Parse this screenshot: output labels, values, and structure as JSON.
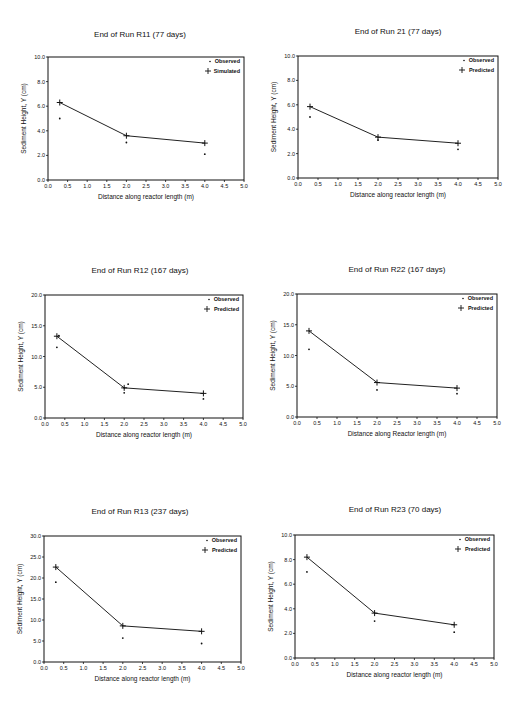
{
  "page": {
    "caption": ""
  },
  "chart_data": [
    {
      "id": "r11",
      "type": "line",
      "title": "End of Run R11 (77 days)",
      "xlabel": "Distance along reactor length (m)",
      "ylabel": "Sediment Height, Y (cm)",
      "xlim": [
        0.0,
        5.0
      ],
      "ylim": [
        0.0,
        10.0
      ],
      "xticks": [
        "0.0",
        "0.5",
        "1.0",
        "1.5",
        "2.0",
        "2.5",
        "3.0",
        "3.5",
        "4.0",
        "4.5",
        "5.0"
      ],
      "yticks": [
        "0.0",
        "2.0",
        "4.0",
        "6.0",
        "8.0",
        "10.0"
      ],
      "legend": [
        "Observed",
        "Simulated"
      ],
      "legend_position": "upper right",
      "grid": false,
      "series": [
        {
          "name": "Simulated",
          "style": "line+cross",
          "x": [
            0.3,
            2.0,
            4.0
          ],
          "y": [
            6.3,
            3.6,
            3.0
          ]
        },
        {
          "name": "Observed",
          "style": "dot",
          "x": [
            0.3,
            2.0,
            4.0
          ],
          "y": [
            5.0,
            3.05,
            2.1
          ]
        }
      ],
      "frame": {
        "left": 48,
        "right": 244,
        "top": 57,
        "bottom": 180,
        "title_y": 30,
        "title_x": 140
      }
    },
    {
      "id": "r21",
      "type": "line",
      "title": "End of Run 21 (77 days)",
      "xlabel": "Distance along reactor length (m)",
      "ylabel": "Sediment Height, Y (cm)",
      "xlim": [
        0.0,
        5.0
      ],
      "ylim": [
        0.0,
        10.0
      ],
      "xticks": [
        "0.0",
        "0.5",
        "1.0",
        "1.5",
        "2.0",
        "2.5",
        "3.0",
        "3.5",
        "4.0",
        "4.5",
        "5.0"
      ],
      "yticks": [
        "0.0",
        "2.0",
        "4.0",
        "6.0",
        "8.0",
        "10.0"
      ],
      "legend": [
        "Observed",
        "Predicted"
      ],
      "legend_position": "upper right",
      "grid": false,
      "series": [
        {
          "name": "Predicted",
          "style": "line+cross",
          "x": [
            0.3,
            2.0,
            4.0
          ],
          "y": [
            5.85,
            3.35,
            2.85
          ]
        },
        {
          "name": "Observed",
          "style": "dot",
          "x": [
            0.3,
            2.0,
            4.0
          ],
          "y": [
            5.0,
            3.1,
            2.35
          ]
        }
      ],
      "frame": {
        "left": 298,
        "right": 498,
        "top": 56,
        "bottom": 178,
        "title_y": 27,
        "title_x": 398
      }
    },
    {
      "id": "r12",
      "type": "line",
      "title": "End of Run R12 (167 days)",
      "xlabel": "Distance along reactor length (m)",
      "ylabel": "Sediment Height, Y (cm)",
      "xlim": [
        0.0,
        5.0
      ],
      "ylim": [
        0.0,
        20.0
      ],
      "xticks": [
        "0.0",
        "0.5",
        "1.0",
        "1.5",
        "2.0",
        "2.5",
        "3.0",
        "3.5",
        "4.0",
        "4.5",
        "5.0"
      ],
      "yticks": [
        "0.0",
        "5.0",
        "10.0",
        "15.0",
        "20.0"
      ],
      "legend": [
        "Observed",
        "Predicted"
      ],
      "legend_position": "upper right",
      "grid": false,
      "series": [
        {
          "name": "Predicted",
          "style": "line+cross",
          "x": [
            0.3,
            2.0,
            4.0
          ],
          "y": [
            13.3,
            4.9,
            4.0
          ]
        },
        {
          "name": "Observed",
          "style": "dot",
          "x": [
            0.3,
            0.35,
            2.0,
            2.0,
            2.1,
            4.0
          ],
          "y": [
            11.5,
            13.4,
            4.1,
            4.9,
            5.5,
            3.1
          ]
        }
      ],
      "frame": {
        "left": 45,
        "right": 243,
        "top": 295,
        "bottom": 418,
        "title_y": 266,
        "title_x": 140
      }
    },
    {
      "id": "r22",
      "type": "line",
      "title": "End of Run R22 (167 days)",
      "xlabel": "Distance along Reactor length (m)",
      "ylabel": "Sediment Height, Y (cm)",
      "xlim": [
        0.0,
        5.0
      ],
      "ylim": [
        0.0,
        20.0
      ],
      "xticks": [
        "0.0",
        "0.5",
        "1.0",
        "1.5",
        "2.0",
        "2.5",
        "3.0",
        "3.5",
        "4.0",
        "4.5",
        "5.0"
      ],
      "yticks": [
        "0.0",
        "5.0",
        "10.0",
        "15.0",
        "20.0"
      ],
      "legend": [
        "Observed",
        "Predicted"
      ],
      "legend_position": "upper right",
      "grid": false,
      "series": [
        {
          "name": "Predicted",
          "style": "line+cross",
          "x": [
            0.3,
            2.0,
            4.0
          ],
          "y": [
            14.0,
            5.6,
            4.7
          ]
        },
        {
          "name": "Observed",
          "style": "dot",
          "x": [
            0.3,
            2.0,
            4.0
          ],
          "y": [
            11.0,
            4.4,
            3.8
          ]
        }
      ],
      "frame": {
        "left": 297,
        "right": 497,
        "top": 294,
        "bottom": 417,
        "title_y": 265,
        "title_x": 397
      }
    },
    {
      "id": "r13",
      "type": "line",
      "title": "End of Run R13 (237 days)",
      "xlabel": "Distance along reactor length (m)",
      "ylabel": "Sediment Height, Y (cm)",
      "xlim": [
        0.0,
        5.0
      ],
      "ylim": [
        0.0,
        30.0
      ],
      "xticks": [
        "0.0",
        "0.5",
        "1.0",
        "1.5",
        "2.0",
        "2.5",
        "3.0",
        "3.5",
        "4.0",
        "4.5",
        "5.0"
      ],
      "yticks": [
        "0.0",
        "5.0",
        "10.0",
        "15.0",
        "20.0",
        "25.0",
        "30.0"
      ],
      "legend": [
        "Observed",
        "Predicted"
      ],
      "legend_position": "upper right",
      "grid": false,
      "series": [
        {
          "name": "Predicted",
          "style": "line+cross",
          "x": [
            0.3,
            2.0,
            4.0
          ],
          "y": [
            22.6,
            8.6,
            7.3
          ]
        },
        {
          "name": "Observed",
          "style": "dot",
          "x": [
            0.3,
            2.0,
            4.0
          ],
          "y": [
            19.0,
            5.7,
            4.4
          ]
        }
      ],
      "frame": {
        "left": 44,
        "right": 241,
        "top": 536,
        "bottom": 662,
        "title_y": 507,
        "title_x": 140
      }
    },
    {
      "id": "r23",
      "type": "line",
      "title": "End of Run R23 (70 days)",
      "xlabel": "Distance along reactor length (m)",
      "ylabel": "Sediment Height, Y (cm)",
      "xlim": [
        0.0,
        5.0
      ],
      "ylim": [
        0.0,
        10.0
      ],
      "xticks": [
        "0.0",
        "0.5",
        "1.0",
        "1.5",
        "2.0",
        "2.5",
        "3.0",
        "3.5",
        "4.0",
        "4.5",
        "5.0"
      ],
      "yticks": [
        "0.0",
        "2.0",
        "4.0",
        "6.0",
        "8.0",
        "10.0"
      ],
      "legend": [
        "Observed",
        "Predicted"
      ],
      "legend_position": "upper right",
      "grid": false,
      "series": [
        {
          "name": "Predicted",
          "style": "line+cross",
          "x": [
            0.3,
            2.0,
            4.0
          ],
          "y": [
            8.2,
            3.65,
            2.7
          ]
        },
        {
          "name": "Observed",
          "style": "dot",
          "x": [
            0.3,
            2.0,
            4.0
          ],
          "y": [
            7.0,
            3.0,
            2.1
          ]
        }
      ],
      "frame": {
        "left": 295,
        "right": 494,
        "top": 535,
        "bottom": 658,
        "title_y": 505,
        "title_x": 395
      }
    }
  ]
}
